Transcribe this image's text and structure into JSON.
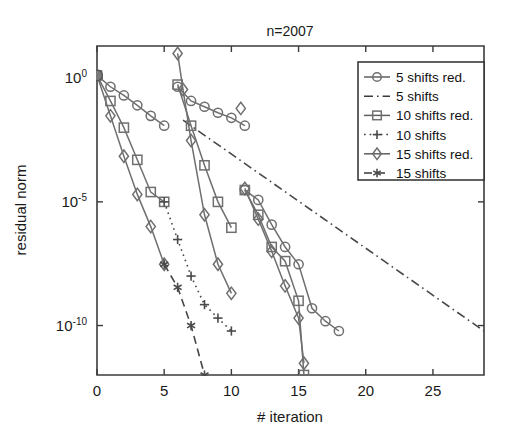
{
  "figure": {
    "title": "n=2007",
    "width": 518,
    "height": 444
  },
  "chart_data": {
    "type": "line",
    "title": "n=2007",
    "xlabel": "# iteration",
    "ylabel": "residual norm",
    "yscale": "log",
    "xlim": [
      0,
      28.8
    ],
    "ylim": [
      1e-12,
      20
    ],
    "grid": false,
    "legend_position": "upper-right",
    "xticks": [
      0,
      5,
      10,
      15,
      20,
      25
    ],
    "xtick_labels": [
      "0",
      "5",
      "10",
      "15",
      "20",
      "25"
    ],
    "yticks": [
      1,
      1e-05,
      1e-10
    ],
    "ytick_labels": [
      "10^0",
      "10^-5",
      "10^-10"
    ],
    "ytick_mantissa": [
      "10",
      "10",
      "10"
    ],
    "ytick_exponents": [
      "0",
      "-5",
      "-10"
    ],
    "series": [
      {
        "name": "5 shifts red.",
        "marker": "circle",
        "linestyle": "solid",
        "color": "#6f6f6f",
        "segments": [
          {
            "x": [
              0,
              1,
              2,
              3,
              4,
              5
            ],
            "y": [
              1.3,
              0.45,
              0.2,
              0.08,
              0.03,
              0.012
            ]
          },
          {
            "x": [
              6,
              7,
              8,
              9,
              10,
              11
            ],
            "y": [
              0.45,
              0.12,
              0.07,
              0.04,
              0.025,
              0.012
            ]
          },
          {
            "x": [
              11,
              12,
              13,
              14,
              15,
              16,
              17,
              18
            ],
            "y": [
              3e-05,
              1.2e-05,
              1.2e-06,
              1.5e-07,
              3e-08,
              5e-10,
              1.5e-10,
              6e-11
            ]
          }
        ]
      },
      {
        "name": "5 shifts",
        "marker": "none",
        "linestyle": "dashdot",
        "color": "#3a3a3a",
        "segments": [
          {
            "x": [
              6.4,
              28.8
            ],
            "y": [
              0.02,
              6e-11
            ]
          }
        ]
      },
      {
        "name": "10 shifts red.",
        "marker": "square",
        "linestyle": "solid",
        "color": "#6f6f6f",
        "segments": [
          {
            "x": [
              0,
              1,
              2,
              3,
              4,
              5
            ],
            "y": [
              1.3,
              0.12,
              0.01,
              0.0005,
              2.5e-05,
              1e-05
            ]
          },
          {
            "x": [
              6,
              7,
              8,
              9,
              10
            ],
            "y": [
              0.55,
              0.012,
              0.0003,
              1e-05,
              9e-07
            ]
          },
          {
            "x": [
              11,
              12,
              13,
              14,
              15,
              15.4
            ],
            "y": [
              3e-05,
              3e-06,
              1.5e-07,
              4e-08,
              1e-09,
              1e-12
            ]
          }
        ]
      },
      {
        "name": "10 shifts",
        "marker": "plus",
        "linestyle": "dotted",
        "color": "#5a5a5a",
        "segments": [
          {
            "x": [
              5,
              6,
              7,
              8,
              9,
              10
            ],
            "y": [
              1e-05,
              3e-07,
              1e-08,
              7e-10,
              2e-10,
              6e-11
            ]
          }
        ]
      },
      {
        "name": "15 shifts red.",
        "marker": "diamond",
        "linestyle": "solid",
        "color": "#6f6f6f",
        "segments": [
          {
            "x": [
              0,
              1,
              2,
              3,
              4,
              5
            ],
            "y": [
              1.3,
              0.03,
              0.0007,
              2e-05,
              1e-06,
              3e-08
            ]
          },
          {
            "x": [
              6,
              6.4,
              7,
              8,
              9,
              10
            ],
            "y": [
              10.0,
              0.35,
              0.003,
              3e-06,
              3e-08,
              2e-09
            ]
          },
          {
            "x": [
              11,
              12,
              13,
              14,
              15,
              15.4
            ],
            "y": [
              3.5e-05,
              2e-06,
              1e-07,
              4e-09,
              2e-10,
              3e-12
            ]
          },
          {
            "x": [
              10.7
            ],
            "y": [
              0.06
            ]
          }
        ]
      },
      {
        "name": "15 shifts",
        "marker": "star",
        "linestyle": "dashed",
        "color": "#5a5a5a",
        "segments": [
          {
            "x": [
              5,
              6,
              7,
              8
            ],
            "y": [
              3e-08,
              3.5e-09,
              1e-10,
              1e-12
            ]
          }
        ]
      }
    ],
    "origin_marker": {
      "x": 0,
      "y": 1.3,
      "style": "filled-circle"
    }
  },
  "legend": {
    "entries": [
      {
        "label": "5 shifts red.",
        "marker": "circle",
        "linestyle": "solid"
      },
      {
        "label": "5 shifts",
        "marker": "none",
        "linestyle": "dashdot"
      },
      {
        "label": "10 shifts red.",
        "marker": "square",
        "linestyle": "solid"
      },
      {
        "label": "10 shifts",
        "marker": "plus",
        "linestyle": "dotted"
      },
      {
        "label": "15 shifts red.",
        "marker": "diamond",
        "linestyle": "solid"
      },
      {
        "label": "15 shifts",
        "marker": "star",
        "linestyle": "dashed"
      }
    ]
  }
}
